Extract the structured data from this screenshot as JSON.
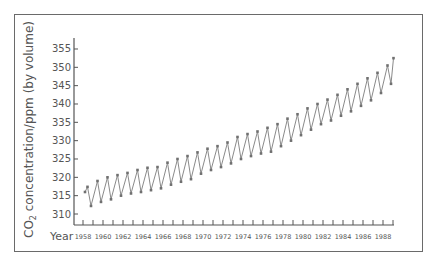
{
  "chart_data": {
    "type": "line",
    "title": "",
    "xlabel": "Year",
    "ylabel": "CO2 concentration/ppm (by volume)",
    "ylabel_parts": {
      "pre": "CO",
      "sub": "2",
      "post": " concentration/ppm (by volume)"
    },
    "xlim": [
      1958,
      1989
    ],
    "ylim": [
      308,
      357
    ],
    "y_ticks": [
      310,
      315,
      320,
      325,
      330,
      335,
      340,
      345,
      350,
      355
    ],
    "x_tick_labels": [
      "1958",
      "1960",
      "1962",
      "1964",
      "1966",
      "1968",
      "1970",
      "1972",
      "1974",
      "1976",
      "1978",
      "1980",
      "1982",
      "1984",
      "1986",
      "1988"
    ],
    "grid": false,
    "legend": null,
    "series": [
      {
        "name": "CO2 (Mauna Loa, seasonal max/min)",
        "x": [
          1958.2,
          1958.45,
          1958.8,
          1959.45,
          1959.8,
          1960.45,
          1960.8,
          1961.45,
          1961.8,
          1962.45,
          1962.8,
          1963.45,
          1963.8,
          1964.45,
          1964.8,
          1965.45,
          1965.8,
          1966.45,
          1966.8,
          1967.45,
          1967.8,
          1968.45,
          1968.8,
          1969.45,
          1969.8,
          1970.45,
          1970.8,
          1971.45,
          1971.8,
          1972.45,
          1972.8,
          1973.45,
          1973.8,
          1974.45,
          1974.8,
          1975.45,
          1975.8,
          1976.45,
          1976.8,
          1977.45,
          1977.8,
          1978.45,
          1978.8,
          1979.45,
          1979.8,
          1980.45,
          1980.8,
          1981.45,
          1981.8,
          1982.45,
          1982.8,
          1983.45,
          1983.8,
          1984.45,
          1984.8,
          1985.45,
          1985.8,
          1986.45,
          1986.8,
          1987.45,
          1987.8,
          1988.45,
          1988.8,
          1989.05
        ],
        "values": [
          316.0,
          317.4,
          312.2,
          319.0,
          313.3,
          320.0,
          314.0,
          320.6,
          315.0,
          321.2,
          315.6,
          322.0,
          316.0,
          322.6,
          316.5,
          322.8,
          317.0,
          324.0,
          318.0,
          325.0,
          318.8,
          325.8,
          319.5,
          326.8,
          321.0,
          327.8,
          322.0,
          328.5,
          322.8,
          329.5,
          323.8,
          331.0,
          325.0,
          331.8,
          325.8,
          332.5,
          326.5,
          333.5,
          327.0,
          334.5,
          328.5,
          336.0,
          330.0,
          337.2,
          331.5,
          338.8,
          333.0,
          340.0,
          334.5,
          341.2,
          335.5,
          342.5,
          336.8,
          344.0,
          338.0,
          345.5,
          339.5,
          347.0,
          341.0,
          348.5,
          343.0,
          350.5,
          345.5,
          352.5
        ]
      }
    ]
  },
  "colors": {
    "line": "#8a8a8a",
    "marker": "#707070",
    "axis": "#555555",
    "frame": "#6a6a6a",
    "text": "#555555"
  }
}
